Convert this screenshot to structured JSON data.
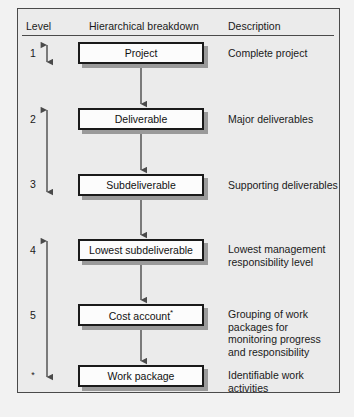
{
  "diagram": {
    "columns": {
      "level": "Level",
      "breakdown": "Hierarchical breakdown",
      "description": "Description"
    },
    "colors": {
      "background": "#ebebeb",
      "frame_border": "#4a4a4a",
      "node_fill": "#fcfcfc",
      "node_border": "#1a1a1a",
      "node_shadow": "#9a9a9a",
      "arrow": "#4a4a4a",
      "text": "#1a1a1a"
    },
    "rows": [
      {
        "level": "1",
        "node": "Project",
        "node_suffix": "",
        "description": "Complete project"
      },
      {
        "level": "2",
        "node": "Deliverable",
        "node_suffix": "",
        "description": "Major deliverables"
      },
      {
        "level": "3",
        "node": "Subdeliverable",
        "node_suffix": "",
        "description": "Supporting deliverables"
      },
      {
        "level": "4",
        "node": "Lowest subdeliverable",
        "node_suffix": "",
        "description": "Lowest management responsibility level"
      },
      {
        "level": "5",
        "node": "Cost account",
        "node_suffix": "*",
        "description": "Grouping of work packages for monitoring progress and responsibility"
      },
      {
        "level": "*",
        "node": "Work package",
        "node_suffix": "",
        "description": "Identifiable work activities"
      }
    ]
  }
}
